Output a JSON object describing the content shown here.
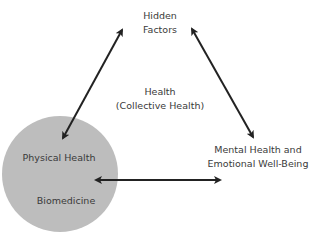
{
  "diagram": {
    "nodes": {
      "hidden_factors": {
        "line1": "Hidden",
        "line2": "Factors"
      },
      "center": {
        "line1": "Health",
        "line2": "(Collective Health)"
      },
      "physical": {
        "label": "Physical Health",
        "sublabel": "Biomedicine"
      },
      "mental": {
        "line1": "Mental Health and",
        "line2": "Emotional Well-Being"
      }
    },
    "edges": [
      {
        "from": "hidden_factors",
        "to": "physical",
        "type": "bidirectional"
      },
      {
        "from": "hidden_factors",
        "to": "mental",
        "type": "bidirectional"
      },
      {
        "from": "physical",
        "to": "mental",
        "type": "bidirectional"
      }
    ],
    "colors": {
      "circle": "#bdbdbd",
      "arrow": "#222222",
      "text": "#3a3a3a"
    }
  }
}
